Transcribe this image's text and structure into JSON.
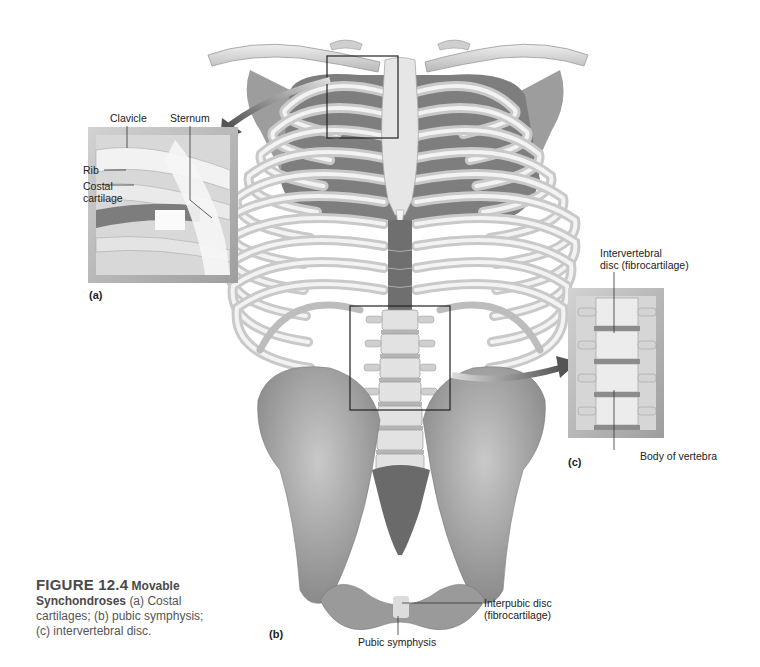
{
  "figure": {
    "number": "FIGURE 12.4",
    "title_part1": "Movable",
    "title_part2": "Synchondroses",
    "description_line1": "(a) Costal",
    "description_line2": "cartilages; (b) pubic symphysis;",
    "description_line3": "(c) intervertebral disc."
  },
  "panels": {
    "a": "(a)",
    "b": "(b)",
    "c": "(c)"
  },
  "labels": {
    "clavicle": "Clavicle",
    "sternum": "Sternum",
    "rib": "Rib",
    "costal_cartilage_1": "Costal",
    "costal_cartilage_2": "cartilage",
    "intervertebral_disc_1": "Intervertebral",
    "intervertebral_disc_2": "disc (fibrocartilage)",
    "body_of_vertebra": "Body of vertebra",
    "interpubic_disc_1": "Interpubic disc",
    "interpubic_disc_2": "(fibrocartilage)",
    "pubic_symphysis": "Pubic symphysis"
  },
  "colors": {
    "bone": "#dcdcdc",
    "bone_shadow": "#9a9a9a",
    "muscle": "#7a7a7a",
    "inset_frame": "#a9a9a9",
    "arrow": "#6e6e6e",
    "callout_box": "#222222"
  }
}
